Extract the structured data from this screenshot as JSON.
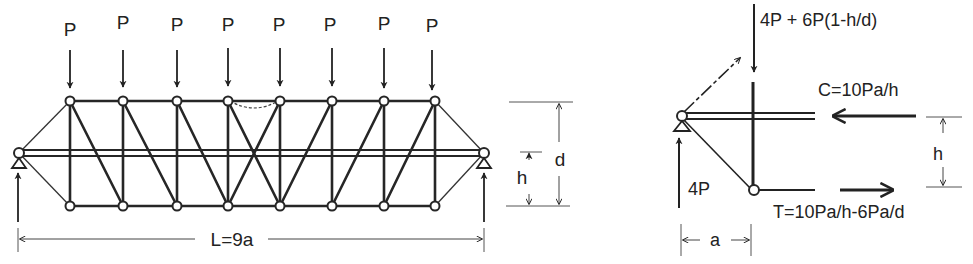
{
  "truss": {
    "load_labels": [
      "P",
      "P",
      "P",
      "P",
      "P",
      "P",
      "P",
      "P"
    ],
    "span_label": "L=9a",
    "depth_label": "d",
    "height_label": "h"
  },
  "free_body": {
    "vertical_force_label": "4P + 6P(1-h/d)",
    "compression_label": "C=10Pa/h",
    "tension_label": "T=10Pa/h-6Pa/d",
    "reaction_label": "4P",
    "panel_label": "a",
    "height_label": "h"
  }
}
